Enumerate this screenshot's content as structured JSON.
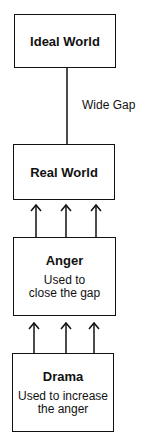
{
  "diagram": {
    "boxes": [
      {
        "id": "ideal",
        "title": "Ideal World",
        "subtitle": ""
      },
      {
        "id": "real",
        "title": "Real World",
        "subtitle": ""
      },
      {
        "id": "anger",
        "title": "Anger",
        "subtitle_line1": "Used to",
        "subtitle_line2": "close the gap"
      },
      {
        "id": "drama",
        "title": "Drama",
        "subtitle_line1": "Used to increase",
        "subtitle_line2": "the anger"
      }
    ],
    "gap_label": "Wide Gap",
    "connections": [
      {
        "from": "ideal",
        "to": "real",
        "type": "line",
        "label": "Wide Gap"
      },
      {
        "from": "anger",
        "to": "real",
        "type": "arrows",
        "count": 3
      },
      {
        "from": "drama",
        "to": "anger",
        "type": "arrows",
        "count": 3
      }
    ]
  }
}
